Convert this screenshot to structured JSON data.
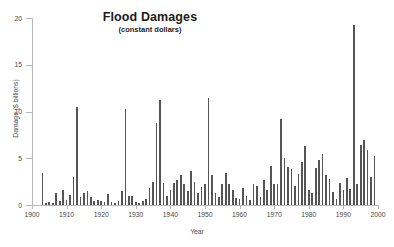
{
  "chart": {
    "title": "Flood Damages",
    "subtitle": "(constant dollars)",
    "ylabel": "Damage ($ billions)",
    "xlabel": "Year"
  },
  "chart_data": {
    "type": "bar",
    "title": "Flood Damages",
    "subtitle": "(constant dollars)",
    "xlabel": "Year",
    "ylabel": "Damage ($ billions)",
    "xlim": [
      1900,
      2000
    ],
    "ylim": [
      0,
      20
    ],
    "yticks": [
      0,
      5,
      10,
      15,
      20
    ],
    "xticks": [
      1900,
      1910,
      1920,
      1930,
      1940,
      1950,
      1960,
      1970,
      1980,
      1990,
      2000
    ],
    "grid": false,
    "legend": null,
    "bar_color": "#555555",
    "categories": [
      1903,
      1904,
      1905,
      1906,
      1907,
      1908,
      1909,
      1910,
      1911,
      1912,
      1913,
      1914,
      1915,
      1916,
      1917,
      1918,
      1919,
      1920,
      1921,
      1922,
      1923,
      1924,
      1925,
      1926,
      1927,
      1928,
      1929,
      1930,
      1931,
      1932,
      1933,
      1934,
      1935,
      1936,
      1937,
      1938,
      1939,
      1940,
      1941,
      1942,
      1943,
      1944,
      1945,
      1946,
      1947,
      1948,
      1949,
      1950,
      1951,
      1952,
      1953,
      1954,
      1955,
      1956,
      1957,
      1958,
      1959,
      1960,
      1961,
      1962,
      1963,
      1964,
      1965,
      1966,
      1967,
      1968,
      1969,
      1970,
      1971,
      1972,
      1973,
      1974,
      1975,
      1976,
      1977,
      1978,
      1979,
      1980,
      1981,
      1982,
      1983,
      1984,
      1985,
      1986,
      1987,
      1988,
      1989,
      1990,
      1991,
      1992,
      1993,
      1994,
      1995,
      1996,
      1997,
      1998,
      1999
    ],
    "values": [
      3.4,
      0.2,
      0.3,
      0.2,
      1.3,
      0.4,
      1.6,
      0.5,
      1.1,
      3.0,
      10.5,
      0.9,
      1.3,
      1.5,
      0.9,
      0.4,
      0.5,
      0.4,
      0.3,
      1.2,
      0.3,
      0.2,
      0.4,
      1.5,
      10.3,
      1.0,
      1.0,
      0.3,
      0.2,
      0.4,
      0.6,
      1.8,
      2.5,
      8.8,
      11.2,
      2.4,
      1.0,
      1.6,
      2.4,
      2.7,
      3.2,
      2.2,
      1.5,
      3.6,
      2.5,
      1.3,
      1.9,
      2.3,
      11.4,
      3.2,
      1.3,
      0.9,
      2.3,
      3.4,
      2.3,
      1.6,
      0.8,
      0.6,
      1.8,
      1.0,
      0.5,
      2.2,
      2.0,
      0.9,
      2.7,
      1.6,
      4.2,
      2.3,
      2.2,
      9.2,
      5.0,
      4.1,
      3.9,
      2.0,
      3.3,
      4.6,
      6.3,
      1.6,
      1.3,
      4.0,
      4.8,
      5.5,
      3.2,
      2.8,
      1.4,
      0.6,
      2.4,
      1.6,
      2.9,
      1.7,
      19.3,
      2.3,
      6.4,
      7.0,
      5.9,
      3.0,
      5.2
    ]
  }
}
